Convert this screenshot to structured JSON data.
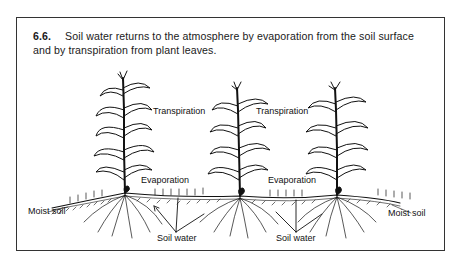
{
  "figure": {
    "number": "6.6.",
    "caption": "Soil water returns to the atmosphere by evaporation from the soil surface and by transpiration from plant leaves.",
    "labels": {
      "transpiration_left": "Transpiration",
      "transpiration_right": "Transpiration",
      "evaporation_left": "Evaporation",
      "evaporation_right": "Evaporation",
      "moist_soil_left": "Moist soil",
      "moist_soil_right": "Moist soil",
      "soil_water_left": "Soil water",
      "soil_water_right": "Soil water"
    },
    "colors": {
      "ink": "#111111",
      "border": "#333333",
      "background": "#ffffff"
    }
  }
}
